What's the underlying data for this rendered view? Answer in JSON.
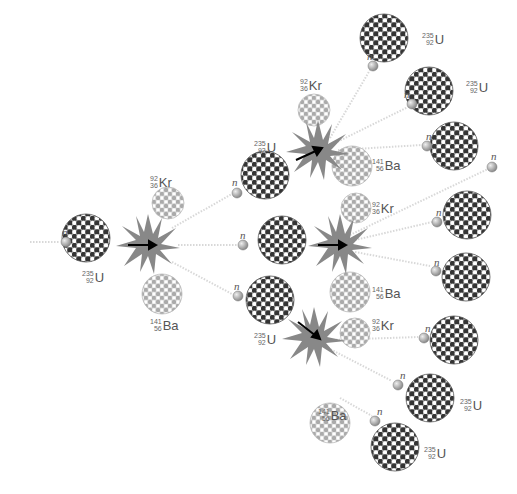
{
  "diagram": {
    "neutron_symbol": "n",
    "isotopes": {
      "uranium": {
        "mass": "235",
        "atomic": "92",
        "symbol": "U"
      },
      "krypton": {
        "mass": "92",
        "atomic": "36",
        "symbol": "Kr"
      },
      "barium": {
        "mass": "141",
        "atomic": "56",
        "symbol": "Ba"
      }
    },
    "colors": {
      "uranium_dark": "#333333",
      "uranium_light": "#ffffff",
      "fragment_dot": "#aaaaaa",
      "flash": "#888888",
      "neutron": "#999999",
      "trail": "#dddddd"
    },
    "generations": [
      {
        "level": 1,
        "fissions": 1,
        "neutrons_released": 3
      },
      {
        "level": 2,
        "fissions": 3,
        "neutrons_released": 9
      }
    ]
  }
}
